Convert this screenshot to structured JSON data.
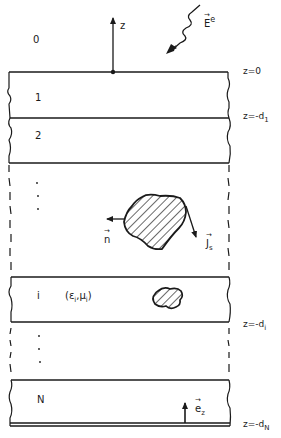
{
  "figure": {
    "type": "layered-medium-diagram",
    "colors": {
      "ink": "#1a1a1a",
      "background": "#ffffff"
    },
    "axis": {
      "label": "z"
    },
    "incident_field": {
      "symbol": "E",
      "superscript": "e"
    },
    "layers": [
      {
        "label": "0"
      },
      {
        "label": "1"
      },
      {
        "label": "2"
      },
      {
        "label": "i",
        "params": "(ε",
        "eps_sub": "i",
        "mid": ",μ",
        "mu_sub": "i",
        "close": ")"
      },
      {
        "label": "N"
      }
    ],
    "continuation_dots": [
      "·",
      "·",
      "·"
    ],
    "interfaces": [
      {
        "prefix": "z=0",
        "sub": ""
      },
      {
        "prefix": "z=-d",
        "sub": "1"
      },
      {
        "prefix": "z=-d",
        "sub": "i"
      },
      {
        "prefix": "z=-d",
        "sub": "N"
      }
    ],
    "scatterer": {
      "normal_label": "n",
      "current_label": "J",
      "current_sub": "s"
    },
    "unit_vector": {
      "symbol": "e",
      "sub": "z"
    }
  }
}
